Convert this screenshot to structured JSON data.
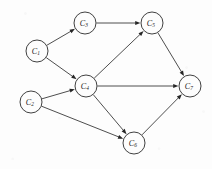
{
  "figure": {
    "kind": "directed-graph",
    "background_color": "#fdfdfd",
    "node_stroke_color": "#2b2b2b",
    "edge_color": "#3a3a3a",
    "label_color": "#1a1a1a",
    "node_radius": 11,
    "width": 212,
    "height": 169
  },
  "nodes": [
    {
      "id": "C1",
      "label": "C",
      "subscript": "1",
      "full_label": "C₁",
      "x": 37,
      "y": 51
    },
    {
      "id": "C2",
      "label": "C",
      "subscript": "2",
      "full_label": "C₂",
      "x": 31,
      "y": 102
    },
    {
      "id": "C3",
      "label": "C",
      "subscript": "3",
      "full_label": "C₃",
      "x": 85,
      "y": 23
    },
    {
      "id": "C4",
      "label": "C",
      "subscript": "4",
      "full_label": "C₄",
      "x": 86,
      "y": 86
    },
    {
      "id": "C5",
      "label": "C",
      "subscript": "5",
      "full_label": "C₅",
      "x": 152,
      "y": 23
    },
    {
      "id": "C6",
      "label": "C",
      "subscript": "6",
      "full_label": "C₆",
      "x": 134,
      "y": 143
    },
    {
      "id": "C7",
      "label": "C",
      "subscript": "7",
      "full_label": "C₇",
      "x": 190,
      "y": 86
    }
  ],
  "edges": [
    {
      "from": "C1",
      "to": "C3",
      "directed": true
    },
    {
      "from": "C1",
      "to": "C4",
      "directed": true
    },
    {
      "from": "C2",
      "to": "C4",
      "directed": true
    },
    {
      "from": "C2",
      "to": "C6",
      "directed": true
    },
    {
      "from": "C3",
      "to": "C5",
      "directed": true
    },
    {
      "from": "C4",
      "to": "C5",
      "directed": true
    },
    {
      "from": "C4",
      "to": "C7",
      "directed": true
    },
    {
      "from": "C4",
      "to": "C6",
      "directed": true
    },
    {
      "from": "C5",
      "to": "C7",
      "directed": true
    },
    {
      "from": "C6",
      "to": "C7",
      "directed": true
    }
  ]
}
